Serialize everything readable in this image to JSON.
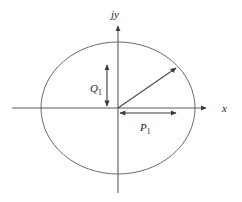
{
  "figure": {
    "title": "",
    "background_color": "#ffffff",
    "stroke_color": "#555555",
    "text_color": "#1a1a1a",
    "axes": {
      "x_axis": {
        "label": "x",
        "label_x": 225,
        "label_y": 112,
        "line": {
          "x1": 12,
          "y1": 108,
          "x2": 208,
          "y2": 108
        },
        "arrow_at": "end"
      },
      "y_axis": {
        "label_prefix": "j",
        "label_suffix": "y",
        "label": "jy",
        "label_x": 113,
        "label_y": 16,
        "line": {
          "x1": 118,
          "y1": 193,
          "x2": 118,
          "y2": 24
        },
        "arrow_at": "end"
      }
    },
    "circle": {
      "name": "unit-circle",
      "center_x": 118,
      "center_y": 108,
      "radius_x": 77,
      "radius_y": 66
    },
    "radius_vector": {
      "name": "radius-vector",
      "from_x": 118,
      "from_y": 108,
      "to_x": 178,
      "to_y": 66,
      "arrow_at": "end"
    },
    "measures": [
      {
        "name": "q1-measure",
        "label": "Q",
        "subscript": "1",
        "orientation": "vertical",
        "x": 107,
        "y_top": 63,
        "y_bottom": 108,
        "label_x": 93,
        "label_y": 89,
        "arrow_at": "both"
      },
      {
        "name": "p1-measure",
        "label": "P",
        "subscript": "1",
        "orientation": "horizontal",
        "y": 113,
        "x_left": 118,
        "x_right": 178,
        "label_x": 142,
        "label_y": 130,
        "arrow_at": "both"
      }
    ]
  }
}
